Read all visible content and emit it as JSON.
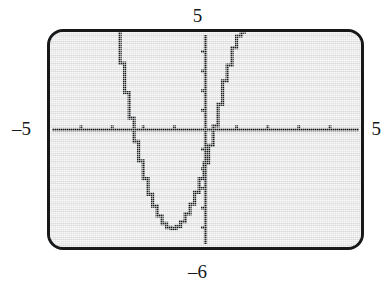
{
  "figure": {
    "kind": "graphing-calculator-screen",
    "background_color": "#ffffff",
    "screen_color": "#e2e2e2",
    "ink_color": "#16181a"
  },
  "labels": {
    "ymax": "5",
    "ymin": "–6",
    "xmin": "–5",
    "xmax": "5"
  },
  "chart_data": {
    "type": "line",
    "title": "",
    "subtitle": "",
    "xlabel": "",
    "ylabel": "",
    "xlim": [
      -5,
      5
    ],
    "ylim": [
      -6,
      5
    ],
    "grid": false,
    "legend": null,
    "axis_style": "calculator-tick-axes",
    "x_tick_interval": 1,
    "y_tick_interval": 1,
    "x_ticks": [
      -5,
      -4,
      -3,
      -2,
      -1,
      1,
      2,
      3,
      4,
      5
    ],
    "y_ticks": [
      -6,
      -5,
      -4,
      -3,
      -2,
      -1,
      1,
      2,
      3,
      4,
      5
    ],
    "series": [
      {
        "name": "parabola",
        "shape": "upward parabola",
        "vertex": [
          -0.9,
          -5.0
        ],
        "x_intercepts": [
          -2.3,
          0.8
        ],
        "y_intercept": -4.2,
        "x": [
          -2.75,
          -2.6,
          -2.45,
          -2.3,
          -2.15,
          -2.0,
          -1.85,
          -1.7,
          -1.55,
          -1.4,
          -1.25,
          -1.1,
          -0.95,
          -0.8,
          -0.65,
          -0.5,
          -0.35,
          -0.2,
          -0.05,
          0.1,
          0.25,
          0.4,
          0.55,
          0.7,
          0.85,
          1.0,
          1.15,
          1.3
        ],
        "y": [
          5.0,
          3.4,
          1.9,
          0.6,
          -0.6,
          -1.6,
          -2.5,
          -3.3,
          -3.9,
          -4.4,
          -4.8,
          -5.0,
          -5.05,
          -4.95,
          -4.7,
          -4.3,
          -3.8,
          -3.2,
          -2.5,
          -1.7,
          -0.8,
          0.2,
          1.3,
          2.5,
          3.3,
          4.2,
          4.8,
          5.0
        ]
      }
    ]
  }
}
